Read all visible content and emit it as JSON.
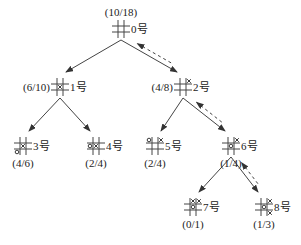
{
  "diagram": {
    "type": "game-tree",
    "game": "tic-tac-toe",
    "colors": {
      "line": "#444444",
      "text": "#222222",
      "background": "#ffffff"
    },
    "nodes": [
      {
        "id": 0,
        "name": "0号",
        "score": "(10/18)",
        "marks": []
      },
      {
        "id": 1,
        "name": "1号",
        "score": "(6/10)",
        "marks": [
          {
            "cell": 4,
            "symbol": "×"
          }
        ]
      },
      {
        "id": 2,
        "name": "2号",
        "score": "(4/8)",
        "marks": [
          {
            "cell": 2,
            "symbol": "×"
          }
        ]
      },
      {
        "id": 3,
        "name": "3号",
        "score": "(4/6)",
        "marks": [
          {
            "cell": 4,
            "symbol": "×"
          },
          {
            "cell": 6,
            "symbol": "○"
          }
        ]
      },
      {
        "id": 4,
        "name": "4号",
        "score": "(2/4)",
        "marks": [
          {
            "cell": 3,
            "symbol": "○"
          },
          {
            "cell": 4,
            "symbol": "×"
          }
        ]
      },
      {
        "id": 5,
        "name": "5号",
        "score": "(2/4)",
        "marks": [
          {
            "cell": 0,
            "symbol": "○"
          },
          {
            "cell": 2,
            "symbol": "×"
          }
        ]
      },
      {
        "id": 6,
        "name": "6号",
        "score": "(1/4)",
        "marks": [
          {
            "cell": 2,
            "symbol": "×"
          },
          {
            "cell": 4,
            "symbol": "○"
          }
        ]
      },
      {
        "id": 7,
        "name": "7号",
        "score": "(0/1)",
        "marks": [
          {
            "cell": 1,
            "symbol": "×"
          },
          {
            "cell": 2,
            "symbol": "×"
          },
          {
            "cell": 4,
            "symbol": "○"
          }
        ]
      },
      {
        "id": 8,
        "name": "8号",
        "score": "(1/3)",
        "marks": [
          {
            "cell": 2,
            "symbol": "×"
          },
          {
            "cell": 4,
            "symbol": "○"
          },
          {
            "cell": 8,
            "symbol": "×"
          }
        ]
      }
    ],
    "edges": [
      {
        "from": 0,
        "to": 1,
        "backprop": false
      },
      {
        "from": 0,
        "to": 2,
        "backprop": true
      },
      {
        "from": 1,
        "to": 3,
        "backprop": false
      },
      {
        "from": 1,
        "to": 4,
        "backprop": false
      },
      {
        "from": 2,
        "to": 5,
        "backprop": false
      },
      {
        "from": 2,
        "to": 6,
        "backprop": true
      },
      {
        "from": 6,
        "to": 7,
        "backprop": false
      },
      {
        "from": 6,
        "to": 8,
        "backprop": true
      }
    ]
  }
}
